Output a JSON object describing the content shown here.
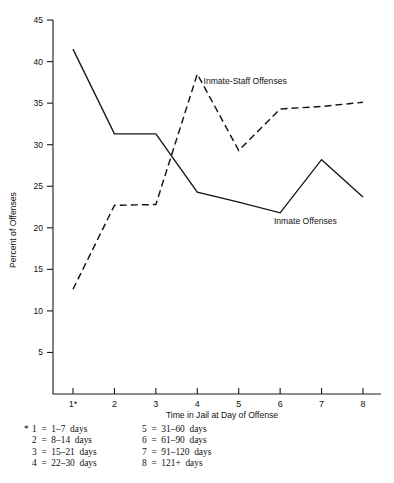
{
  "chart_data": {
    "type": "line",
    "title": "",
    "xlabel": "Time in Jail at Day of Offense",
    "ylabel": "Percent of Offenses",
    "x": [
      1,
      2,
      3,
      4,
      5,
      6,
      7,
      8
    ],
    "xtick_labels": [
      "1*",
      "2",
      "3",
      "4",
      "5",
      "6",
      "7",
      "8"
    ],
    "ytick_labels": [
      "5",
      "10",
      "15",
      "20",
      "25",
      "30",
      "35",
      "40",
      "45"
    ],
    "ytick_values": [
      5,
      10,
      15,
      20,
      25,
      30,
      35,
      40,
      45
    ],
    "ylim": [
      0,
      45
    ],
    "xlim": [
      1,
      8
    ],
    "grid": false,
    "legend_position": "inline-annotation",
    "series": [
      {
        "name": "Inmate Offenses",
        "style": "solid",
        "values": [
          41.5,
          31.3,
          31.3,
          24.3,
          23.1,
          21.8,
          28.2,
          23.7
        ],
        "label_x": 5.85,
        "label_y": 20.5
      },
      {
        "name": "Inmate-Staff Offenses",
        "style": "dashed",
        "values": [
          12.6,
          22.7,
          22.8,
          38.5,
          29.3,
          34.3,
          34.6,
          35.1
        ],
        "label_x": 4.15,
        "label_y": 37.3
      }
    ],
    "annotations": [
      {
        "text": "Inmate-Staff Offenses"
      },
      {
        "text": "Inmate Offenses"
      }
    ]
  },
  "footnote": {
    "star": "*",
    "left_column": [
      "1  =  1–7  days",
      "2  =  8–14  days",
      "3  =  15–21  days",
      "4  =  22–30  days"
    ],
    "right_column": [
      "5  =  31–60  days",
      "6  =  61–90  days",
      "7  =  91–120  days",
      "8  =  121+  days"
    ]
  }
}
